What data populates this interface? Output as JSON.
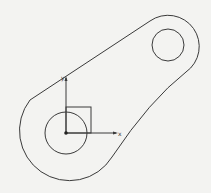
{
  "figure": {
    "type": "cad-sketch",
    "colors": {
      "stroke": "#3a3a3a",
      "background": "#f3f3f1"
    }
  },
  "axes": {
    "x_label": "x",
    "y_label": "y",
    "origin": {
      "x": 66,
      "y": 133
    }
  },
  "shapes": {
    "lower_bore": {
      "cx": 66,
      "cy": 133,
      "r": 21
    },
    "upper_bore": {
      "cx": 168,
      "cy": 45,
      "r": 16
    },
    "lower_boss": {
      "cx": 66,
      "cy": 133,
      "r": 50
    },
    "upper_boss": {
      "cx": 168,
      "cy": 45,
      "r": 30
    },
    "square_marker": {
      "x": 66,
      "y": 107,
      "w": 25,
      "h": 26
    }
  }
}
